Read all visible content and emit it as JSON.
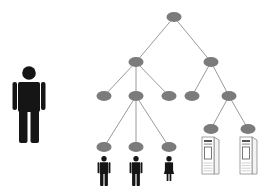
{
  "diagram": {
    "title": "",
    "colors": {
      "node_fill": "#7b7b7b",
      "edge_stroke": "#9a9a9a",
      "person_fill": "#151515",
      "server_stroke": "#8a8a8a",
      "server_fill": "#ffffff",
      "server_detail": "#555555"
    },
    "standalone_person": {
      "x": 29,
      "y": 66,
      "scale": 1.0,
      "type": "man"
    },
    "nodes": [
      {
        "id": "root",
        "x": 174,
        "y": 17
      },
      {
        "id": "L1a",
        "x": 136,
        "y": 62
      },
      {
        "id": "L1b",
        "x": 211,
        "y": 62
      },
      {
        "id": "L2a",
        "x": 104,
        "y": 96
      },
      {
        "id": "L2b",
        "x": 136,
        "y": 96
      },
      {
        "id": "L2c",
        "x": 169,
        "y": 96
      },
      {
        "id": "L2d",
        "x": 192,
        "y": 96
      },
      {
        "id": "L2e",
        "x": 229,
        "y": 96
      },
      {
        "id": "L3a",
        "x": 104,
        "y": 147
      },
      {
        "id": "L3b",
        "x": 136,
        "y": 147
      },
      {
        "id": "L3c",
        "x": 169,
        "y": 147
      },
      {
        "id": "L3d",
        "x": 211,
        "y": 129
      },
      {
        "id": "L3e",
        "x": 248,
        "y": 129
      }
    ],
    "edges": [
      [
        "root",
        "L1a"
      ],
      [
        "root",
        "L1b"
      ],
      [
        "L1a",
        "L2a"
      ],
      [
        "L1a",
        "L2b"
      ],
      [
        "L1a",
        "L2c"
      ],
      [
        "L1b",
        "L2d"
      ],
      [
        "L1b",
        "L2e"
      ],
      [
        "L2b",
        "L3a"
      ],
      [
        "L2b",
        "L3b"
      ],
      [
        "L2b",
        "L3c"
      ],
      [
        "L2e",
        "L3d"
      ],
      [
        "L2e",
        "L3e"
      ]
    ],
    "leaf_icons": [
      {
        "under": "L3a",
        "type": "man",
        "x": 104,
        "y": 156
      },
      {
        "under": "L3b",
        "type": "man",
        "x": 136,
        "y": 156
      },
      {
        "under": "L3c",
        "type": "woman",
        "x": 169,
        "y": 156
      },
      {
        "under": "L3d",
        "type": "server",
        "x": 202,
        "y": 137
      },
      {
        "under": "L3e",
        "type": "server",
        "x": 240,
        "y": 137
      }
    ]
  }
}
